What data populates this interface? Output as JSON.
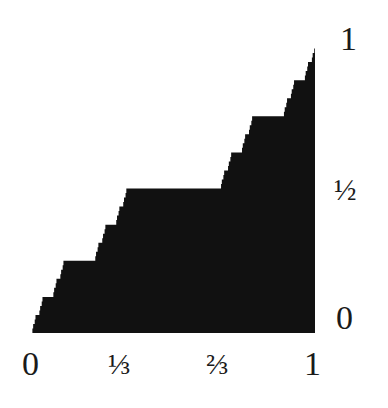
{
  "chart_data": {
    "type": "area",
    "title": "",
    "xlabel": "",
    "ylabel": "",
    "xlim": [
      0,
      1
    ],
    "ylim": [
      0,
      1
    ],
    "grid": false,
    "legend": null,
    "fill_color": "#111111",
    "recursion_depth": 6,
    "key_points": [
      {
        "x": 0,
        "y": 0
      },
      {
        "x": 0.1111,
        "y": 0.25
      },
      {
        "x": 0.2222,
        "y": 0.25
      },
      {
        "x": 0.3333,
        "y": 0.5
      },
      {
        "x": 0.6667,
        "y": 0.5
      },
      {
        "x": 0.7778,
        "y": 0.75
      },
      {
        "x": 0.8889,
        "y": 0.75
      },
      {
        "x": 1,
        "y": 1
      }
    ],
    "plateaus": [
      {
        "x_start": 0.3333,
        "x_end": 0.6667,
        "y": 0.5
      },
      {
        "x_start": 0.1111,
        "x_end": 0.2222,
        "y": 0.25
      },
      {
        "x_start": 0.7778,
        "x_end": 0.8889,
        "y": 0.75
      }
    ]
  },
  "x_axis": {
    "ticks": [
      {
        "label": "0",
        "value": 0
      },
      {
        "label": "⅓",
        "value": 0.3333
      },
      {
        "label": "⅔",
        "value": 0.6667
      },
      {
        "label": "1",
        "value": 1
      }
    ]
  },
  "y_axis": {
    "position": "right",
    "ticks": [
      {
        "label": "1",
        "value": 1
      },
      {
        "label": "½",
        "value": 0.5
      },
      {
        "label": "0",
        "value": 0
      }
    ]
  }
}
